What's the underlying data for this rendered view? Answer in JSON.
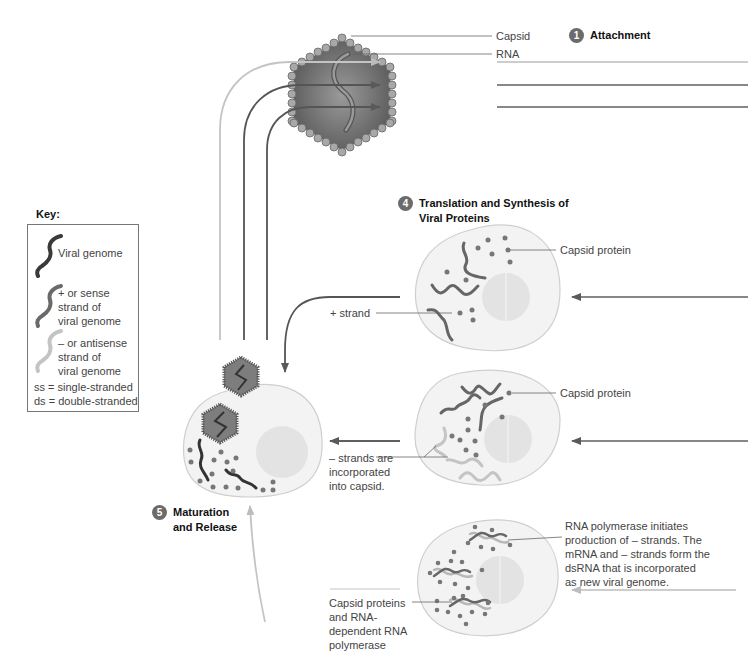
{
  "diagram": {
    "virion": {
      "capsid_label": "Capsid",
      "rna_label": "RNA"
    },
    "steps": [
      {
        "number": "1",
        "title": "Attachment"
      },
      {
        "number": "4",
        "title_line1": "Translation and Synthesis of",
        "title_line2": "Viral Proteins"
      },
      {
        "number": "5",
        "title_line1": "Maturation",
        "title_line2": "and Release"
      }
    ],
    "labels": {
      "capsid_protein_1": "Capsid protein",
      "plus_strand": "+ strand",
      "capsid_protein_2": "Capsid protein",
      "minus_strands": [
        "– strands are",
        "incorporated",
        "into capsid."
      ],
      "rna_polymerase": [
        "RNA polymerase initiates",
        "production of – strands.  The",
        "mRNA and – strands form the",
        "dsRNA that is incorporated",
        "as new viral genome."
      ],
      "capsid_proteins_rdrp": [
        "Capsid proteins",
        "and RNA-",
        "dependent RNA",
        "polymerase"
      ]
    },
    "key": {
      "title": "Key:",
      "items": [
        {
          "icon": "dark-wavy-strand-icon",
          "lines": [
            "Viral genome"
          ]
        },
        {
          "icon": "medium-wavy-strand-icon",
          "lines": [
            "+ or sense",
            "strand of",
            "viral genome"
          ]
        },
        {
          "icon": "light-wavy-strand-icon",
          "lines": [
            "– or antisense",
            "strand of",
            "viral genome"
          ]
        }
      ],
      "abbreviations": [
        "ss = single-stranded",
        "ds = double-stranded"
      ]
    },
    "colors": {
      "dark_strand": "#3a3a3a",
      "plus_strand": "#6a6a6a",
      "minus_strand": "#c4c4c4",
      "cell_fill": "#f3f3f3",
      "nucleus_fill": "#e3e3e3",
      "capsid_fill": "#7d7d7d",
      "badge": "#6b6b6b"
    }
  }
}
